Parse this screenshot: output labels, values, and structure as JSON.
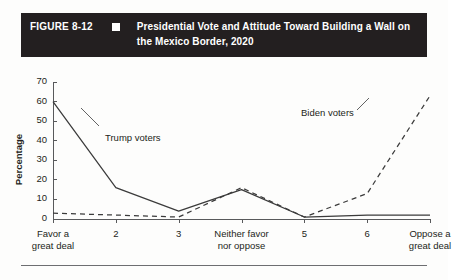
{
  "header": {
    "figure_number": "FIGURE 8-12",
    "marker_icon": "white-square-icon",
    "title": "Presidential Vote and Attitude Toward Building a Wall on the Mexico Border, 2020"
  },
  "chart_data": {
    "type": "line",
    "title": "Presidential Vote and Attitude Toward Building a Wall on the Mexico Border, 2020",
    "xlabel": "",
    "ylabel": "Percentage",
    "ylim": [
      0,
      70
    ],
    "yticks": [
      0,
      10,
      20,
      30,
      40,
      50,
      60,
      70
    ],
    "grid": false,
    "legend_position": "inline-annotations",
    "categories": [
      "Favor a great deal",
      "2",
      "3",
      "Neither favor nor oppose",
      "5",
      "6",
      "Oppose a great deal"
    ],
    "series": [
      {
        "name": "Trump voters",
        "style": "solid",
        "color": "#3b3b3b",
        "values": [
          60,
          16,
          4,
          15,
          1,
          2,
          2
        ]
      },
      {
        "name": "Biden voters",
        "style": "dashed",
        "color": "#3b3b3b",
        "values": [
          3,
          2,
          1,
          16,
          1,
          13,
          63
        ]
      }
    ],
    "annotations": [
      {
        "text": "Trump voters",
        "series": "Trump voters"
      },
      {
        "text": "Biden voters",
        "series": "Biden voters"
      }
    ]
  },
  "colors": {
    "header_background": "#231f20",
    "header_text": "#ffffff",
    "axis": "#58595b",
    "line": "#3b3b3b",
    "page_background": "#fdfdfc"
  }
}
